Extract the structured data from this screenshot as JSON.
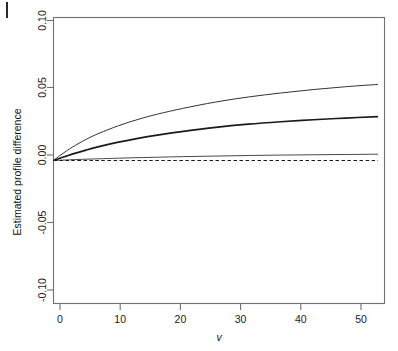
{
  "chart_data": {
    "type": "line",
    "title": "",
    "subtitle": "",
    "xlabel": "v",
    "ylabel": "Estimated profile difference",
    "xlim": [
      0,
      51
    ],
    "ylim": [
      -0.1,
      0.1
    ],
    "grid": false,
    "legend_position": "none",
    "xticks": [
      "0",
      "10",
      "20",
      "30",
      "40",
      "50"
    ],
    "xtick_values": [
      0,
      10,
      20,
      30,
      40,
      50
    ],
    "yticks": [
      "0.10",
      "0.05",
      "0.00",
      "-0.05",
      "-0.10"
    ],
    "ytick_values": [
      0.1,
      0.05,
      0.0,
      -0.05,
      -0.1
    ],
    "x": [
      0,
      1,
      2,
      3,
      5,
      7,
      10,
      13,
      16,
      20,
      25,
      30,
      35,
      40,
      45,
      50
    ],
    "series": [
      {
        "name": "upper-curve",
        "style": "solid",
        "width": 1.0,
        "color": "#333333",
        "values": [
          0.0,
          0.0035,
          0.0067,
          0.0096,
          0.0147,
          0.019,
          0.0243,
          0.0287,
          0.0324,
          0.0365,
          0.0409,
          0.0444,
          0.0472,
          0.0496,
          0.0516,
          0.0532
        ]
      },
      {
        "name": "middle-curve",
        "style": "solid",
        "width": 1.7,
        "color": "#1a1a1a",
        "values": [
          0.0,
          0.0016,
          0.0031,
          0.0046,
          0.0073,
          0.0097,
          0.0128,
          0.0155,
          0.0178,
          0.0204,
          0.0232,
          0.0254,
          0.0271,
          0.0285,
          0.0297,
          0.0307
        ]
      },
      {
        "name": "lower-curve",
        "style": "solid",
        "width": 1.0,
        "color": "#4a4a4a",
        "values": [
          0.0,
          0.0002,
          0.0004,
          0.0006,
          0.0009,
          0.0012,
          0.0016,
          0.002,
          0.0023,
          0.0027,
          0.0031,
          0.0035,
          0.0038,
          0.004,
          0.0042,
          0.0044
        ]
      },
      {
        "name": "zero-reference",
        "style": "dashed",
        "width": 1.1,
        "color": "#1a1a1a",
        "values": [
          0.0,
          0.0,
          0.0,
          0.0,
          0.0,
          0.0,
          0.0,
          0.0,
          0.0,
          0.0,
          0.0,
          0.0,
          0.0,
          0.0,
          0.0,
          0.0
        ]
      }
    ],
    "annotations": []
  }
}
